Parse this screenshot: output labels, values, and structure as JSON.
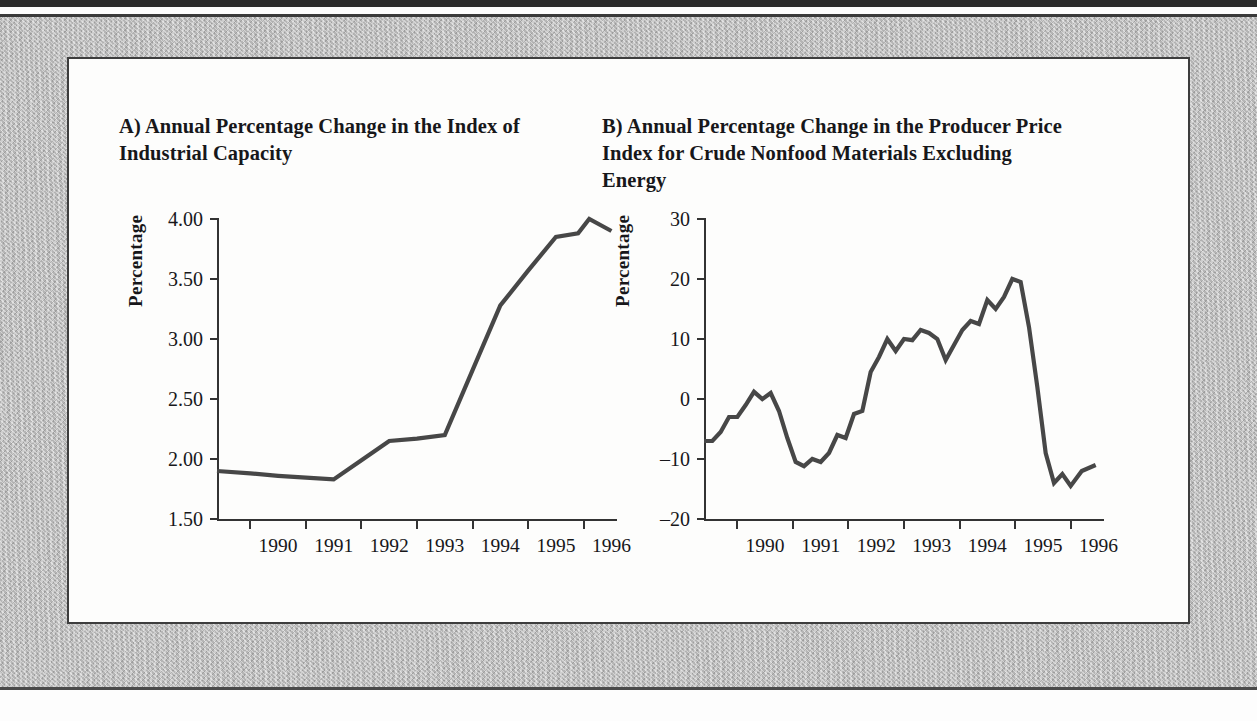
{
  "figure": {
    "panel_label": "figure-panel",
    "line_color": "#474747",
    "axis_color": "#333333",
    "mat_color": "#b9b9b9"
  },
  "charts": [
    {
      "id": "a",
      "title": "A) Annual Percentage Change in the Index of Industrial Capacity",
      "ylabel": "Percentage"
    },
    {
      "id": "b",
      "title": "B) Annual Percentage Change in the Producer Price Index for Crude Nonfood Materials Excluding Energy",
      "ylabel": "Percentage"
    }
  ],
  "chart_data": [
    {
      "type": "line",
      "id": "a",
      "title": "A) Annual Percentage Change in the Index of Industrial Capacity",
      "xlabel": "",
      "ylabel": "Percentage",
      "ylim": [
        1.5,
        4.0
      ],
      "yticks": [
        1.5,
        2.0,
        2.5,
        3.0,
        3.5,
        4.0
      ],
      "ytick_labels": [
        "1.50",
        "2.00",
        "2.50",
        "3.00",
        "3.50",
        "4.00"
      ],
      "xlim": [
        1989.4,
        1996.6
      ],
      "xtick_labels": [
        "1990",
        "1991",
        "1992",
        "1993",
        "1994",
        "1995",
        "1996"
      ],
      "xtick_values": [
        1990,
        1991,
        1992,
        1993,
        1994,
        1995,
        1996
      ],
      "grid": false,
      "legend": "none",
      "x": [
        1989.4,
        1990.0,
        1990.5,
        1991.0,
        1991.5,
        1992.0,
        1992.5,
        1993.0,
        1993.5,
        1994.0,
        1994.5,
        1995.0,
        1995.5,
        1995.9,
        1996.1,
        1996.5
      ],
      "values": [
        1.9,
        1.88,
        1.86,
        1.845,
        1.83,
        1.99,
        2.15,
        2.17,
        2.2,
        2.74,
        3.28,
        3.57,
        3.85,
        3.88,
        4.0,
        3.9
      ]
    },
    {
      "type": "line",
      "id": "b",
      "title": "B) Annual Percentage Change in the Producer Price Index for Crude Nonfood Materials Excluding Energy",
      "xlabel": "",
      "ylabel": "Percentage",
      "ylim": [
        -20,
        30
      ],
      "yticks": [
        -20,
        -10,
        0,
        10,
        20,
        30
      ],
      "ytick_labels": [
        "–20",
        "–10",
        "0",
        "10",
        "20",
        "30"
      ],
      "xlim": [
        1989.4,
        1996.6
      ],
      "xtick_labels": [
        "1990",
        "1991",
        "1992",
        "1993",
        "1994",
        "1995",
        "1996"
      ],
      "xtick_values": [
        1990,
        1991,
        1992,
        1993,
        1994,
        1995,
        1996
      ],
      "grid": false,
      "legend": "none",
      "x": [
        1989.4,
        1989.55,
        1989.7,
        1989.85,
        1990.0,
        1990.15,
        1990.3,
        1990.45,
        1990.6,
        1990.75,
        1990.9,
        1991.05,
        1991.2,
        1991.35,
        1991.5,
        1991.65,
        1991.8,
        1991.95,
        1992.1,
        1992.25,
        1992.4,
        1992.55,
        1992.7,
        1992.85,
        1993.0,
        1993.15,
        1993.3,
        1993.45,
        1993.6,
        1993.75,
        1993.9,
        1994.05,
        1994.2,
        1994.35,
        1994.5,
        1994.65,
        1994.8,
        1994.95,
        1995.1,
        1995.25,
        1995.4,
        1995.55,
        1995.7,
        1995.85,
        1996.0,
        1996.2,
        1996.45
      ],
      "values": [
        -7.0,
        -7.0,
        -5.5,
        -3.0,
        -3.0,
        -1.0,
        1.2,
        0.0,
        1.0,
        -2.0,
        -6.5,
        -10.5,
        -11.2,
        -10.0,
        -10.5,
        -9.0,
        -6.0,
        -6.5,
        -2.5,
        -2.0,
        4.5,
        7.0,
        10.0,
        8.0,
        10.0,
        9.8,
        11.5,
        11.0,
        10.0,
        6.5,
        9.0,
        11.5,
        13.0,
        12.5,
        16.5,
        15.0,
        17.0,
        20.0,
        19.5,
        12.0,
        2.0,
        -9.0,
        -14.0,
        -12.5,
        -14.5,
        -12.0,
        -11.0
      ]
    }
  ]
}
